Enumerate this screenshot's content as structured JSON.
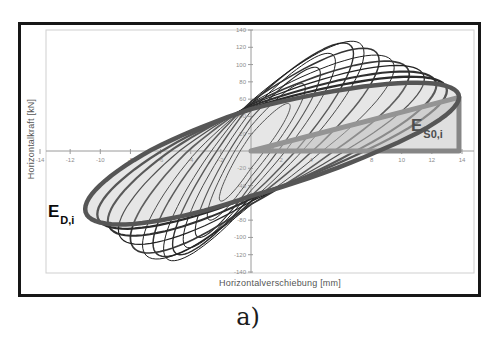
{
  "figure": {
    "caption": "a)"
  },
  "annotations": {
    "ed_base": "E",
    "ed_sub": "D,i",
    "es0_base": "E",
    "es0_sub": "S0,i"
  },
  "chart_data": {
    "type": "line",
    "title": "",
    "xlabel": "Horizontalverschiebung [mm]",
    "ylabel": "Horizontalkraft [kN]",
    "xlim": [
      -14,
      14
    ],
    "ylim": [
      -140,
      140
    ],
    "xticks": [
      -14,
      -12,
      -10,
      -8,
      -6,
      -4,
      -2,
      2,
      4,
      6,
      8,
      10,
      12,
      14
    ],
    "yticks": [
      140,
      120,
      100,
      80,
      60,
      40,
      20,
      -20,
      -40,
      -60,
      -80,
      -100,
      -120,
      -140
    ],
    "grid": false,
    "legend": "none",
    "loops": [
      {
        "a_pos": 2.6,
        "a_neg": 2.1,
        "p_pos": 55,
        "p_neg": 58,
        "phase": 0.35,
        "stroke": "#2a2a2a",
        "width": 1.0
      },
      {
        "a_pos": 3.6,
        "a_neg": 2.9,
        "p_pos": 78,
        "p_neg": 80,
        "phase": 0.38,
        "stroke": "#222222",
        "width": 1.0
      },
      {
        "a_pos": 4.6,
        "a_neg": 3.7,
        "p_pos": 97,
        "p_neg": 100,
        "phase": 0.4,
        "stroke": "#2a2a2a",
        "width": 1.1
      },
      {
        "a_pos": 5.6,
        "a_neg": 4.5,
        "p_pos": 113,
        "p_neg": 112,
        "phase": 0.42,
        "stroke": "#1d1d1d",
        "width": 1.0
      },
      {
        "a_pos": 6.8,
        "a_neg": 5.2,
        "p_pos": 125,
        "p_neg": 120,
        "phase": 0.45,
        "stroke": "#2f2f2f",
        "width": 1.4
      },
      {
        "a_pos": 7.5,
        "a_neg": 5.8,
        "p_pos": 127,
        "p_neg": 127,
        "phase": 0.47,
        "stroke": "#1d1d1d",
        "width": 1.0
      },
      {
        "a_pos": 8.5,
        "a_neg": 6.5,
        "p_pos": 119,
        "p_neg": 122,
        "phase": 0.5,
        "stroke": "#333333",
        "width": 1.5
      },
      {
        "a_pos": 9.5,
        "a_neg": 7.2,
        "p_pos": 111,
        "p_neg": 125,
        "phase": 0.52,
        "stroke": "#1f1f1f",
        "width": 1.0
      },
      {
        "a_pos": 10.5,
        "a_neg": 8.0,
        "p_pos": 104,
        "p_neg": 118,
        "phase": 0.55,
        "stroke": "#383838",
        "width": 1.7
      },
      {
        "a_pos": 11.5,
        "a_neg": 8.8,
        "p_pos": 99,
        "p_neg": 108,
        "phase": 0.57,
        "stroke": "#222222",
        "width": 1.2
      },
      {
        "a_pos": 12.3,
        "a_neg": 9.5,
        "p_pos": 92,
        "p_neg": 98,
        "phase": 0.6,
        "stroke": "#303030",
        "width": 2.1
      },
      {
        "a_pos": 13.0,
        "a_neg": 10.2,
        "p_pos": 86,
        "p_neg": 90,
        "phase": 0.62,
        "stroke": "#2b2b2b",
        "width": 2.3
      }
    ],
    "highlight_loop": {
      "a_pos": 13.8,
      "a_neg": 11.0,
      "p_pos": 79,
      "p_neg": 85,
      "phase": 0.66,
      "stroke": "#565656",
      "width": 4.5,
      "fill": "rgba(178,178,178,0.32)"
    },
    "es0_triangle": {
      "x_mm": 13.8,
      "y_kN": 62,
      "stroke": "#868686",
      "width": 5,
      "fill": "rgba(192,192,192,0.5)"
    },
    "colors": {
      "axis": "#9a9a9a",
      "plot_border": "#cfcfcf",
      "tick_label": "#8c8c8c",
      "frame": "#171717"
    }
  }
}
